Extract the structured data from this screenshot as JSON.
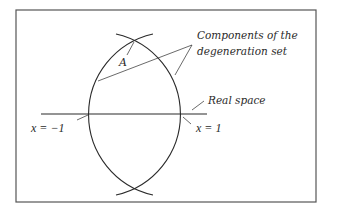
{
  "diagram": {
    "labels": {
      "point_a": "A",
      "components_line1": "Components of the",
      "components_line2": "degeneration set",
      "real_space": "Real space",
      "x_neg": "x = −1",
      "x_pos": "x = 1"
    },
    "colors": {
      "stroke": "#2a2a2a",
      "frame": "#555555",
      "background": "#ffffff"
    }
  }
}
